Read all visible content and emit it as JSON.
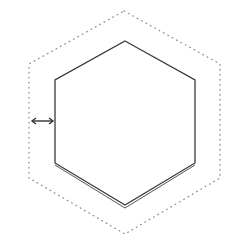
{
  "diagram": {
    "type": "hexagon-offset-illustration",
    "outer_outline": {
      "style": "dotted",
      "color": "#888888"
    },
    "inner_shape": {
      "style": "solid",
      "color": "#333333"
    },
    "offset_indicator": {
      "icon": "double-arrow-horizontal"
    }
  }
}
